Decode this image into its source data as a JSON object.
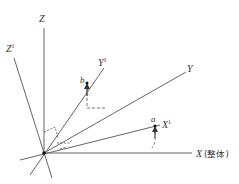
{
  "diagram": {
    "type": "3d-coordinate-axes",
    "colors": {
      "axis": "#555555",
      "text": "#333333",
      "dashed": "#555555",
      "point": "#111111"
    },
    "axes": [
      {
        "id": "Z",
        "label": "Z",
        "superscript": ""
      },
      {
        "id": "Z1",
        "label": "Z",
        "superscript": "1"
      },
      {
        "id": "Y1",
        "label": "Y",
        "superscript": "1"
      },
      {
        "id": "Y",
        "label": "Y",
        "superscript": ""
      },
      {
        "id": "X1",
        "label": "X",
        "superscript": "1"
      },
      {
        "id": "X",
        "label": "X",
        "superscript": "",
        "suffix": "(整体)"
      }
    ],
    "points": [
      {
        "id": "b",
        "label": "b",
        "on_axis": "Y1"
      },
      {
        "id": "a",
        "label": "a",
        "on_axis": "X1"
      }
    ]
  }
}
